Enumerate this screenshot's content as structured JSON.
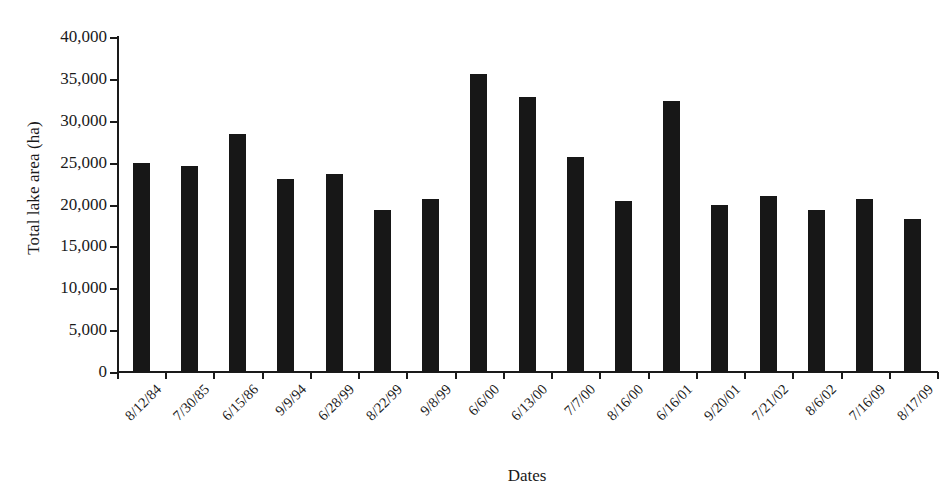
{
  "chart_data": {
    "type": "bar",
    "title": "",
    "subtitle": "",
    "xlabel": "Dates",
    "ylabel": "Total lake area (ha)",
    "ylim": [
      0,
      40000
    ],
    "ytick_step": 5000,
    "ytick_labels": [
      "0",
      "5,000",
      "10,000",
      "15,000",
      "20,000",
      "25,000",
      "30,000",
      "35,000",
      "40,000"
    ],
    "ytick_values": [
      0,
      5000,
      10000,
      15000,
      20000,
      25000,
      30000,
      35000,
      40000
    ],
    "grid": false,
    "legend": false,
    "bar_color": "#171717",
    "categories": [
      "8/12/84",
      "7/30/85",
      "6/15/86",
      "9/9/94",
      "6/28/99",
      "8/22/99",
      "9/8/99",
      "6/6/00",
      "6/13/00",
      "7/7/00",
      "8/16/00",
      "6/16/01",
      "9/20/01",
      "7/21/02",
      "8/6/02",
      "7/16/09",
      "8/17/09"
    ],
    "values": [
      24900,
      24600,
      28400,
      23000,
      23700,
      19400,
      20700,
      35600,
      32800,
      25700,
      20400,
      32400,
      19900,
      21000,
      19400,
      20600,
      18300
    ],
    "series": [
      {
        "name": "Total lake area",
        "values": [
          24900,
          24600,
          28400,
          23000,
          23700,
          19400,
          20700,
          35600,
          32800,
          25700,
          20400,
          32400,
          19900,
          21000,
          19400,
          20600,
          18300
        ]
      }
    ]
  }
}
